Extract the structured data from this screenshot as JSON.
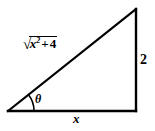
{
  "figure": {
    "stroke_color": "#000000",
    "background_color": "#ffffff",
    "stroke_width": 2
  },
  "labels": {
    "hypotenuse": {
      "text": "√(x² + 4)",
      "radical_sign": "√",
      "radicand_base": "x",
      "radicand_exponent": "2",
      "operator": "+",
      "constant": "4"
    },
    "vertical_side": "2",
    "base_side": "x",
    "angle": "θ"
  },
  "geometry": {
    "left_vertex": [
      8,
      111
    ],
    "bottom_right_vertex": [
      136,
      111
    ],
    "top_right_vertex": [
      136,
      9
    ],
    "angle_arc_radius": 26
  }
}
